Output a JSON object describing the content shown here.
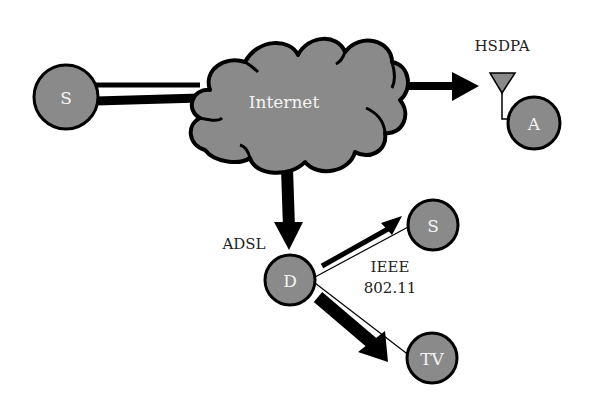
{
  "diagram": {
    "title": "",
    "colors": {
      "node_fill": "#8a8a8a",
      "stroke": "#000000",
      "label_on_node": "#f4f4f4",
      "background": "#ffffff"
    },
    "nodes": {
      "source": {
        "label": "S",
        "cx": 66,
        "cy": 97,
        "r": 32
      },
      "internet": {
        "label": "Internet"
      },
      "mobile": {
        "label": "A",
        "cx": 534,
        "cy": 123,
        "r": 27
      },
      "dslam": {
        "label": "D",
        "cx": 290,
        "cy": 280,
        "r": 26
      },
      "station": {
        "label": "S",
        "cx": 433,
        "cy": 225,
        "r": 26
      },
      "tv": {
        "label": "TV",
        "cx": 432,
        "cy": 358,
        "r": 26
      }
    },
    "labels": {
      "hsdpa": "HSDPA",
      "adsl": "ADSL",
      "wifi_line1": "IEEE",
      "wifi_line2": "802.11"
    },
    "edges": [
      {
        "from": "source",
        "to": "internet",
        "style": "double-line"
      },
      {
        "from": "internet",
        "to": "mobile",
        "style": "thick-arrow",
        "via": "HSDPA"
      },
      {
        "from": "internet",
        "to": "dslam",
        "style": "thick-arrow",
        "via": "ADSL"
      },
      {
        "from": "dslam",
        "to": "station",
        "style": "thin-line + arrow",
        "via": "IEEE 802.11"
      },
      {
        "from": "dslam",
        "to": "tv",
        "style": "thin-line + thick-arrow",
        "via": "IEEE 802.11"
      }
    ]
  }
}
